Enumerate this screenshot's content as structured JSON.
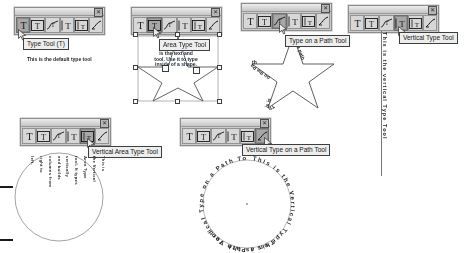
{
  "document": {
    "title": "Illustrator Type Tools Reference Sheet",
    "background_color": "#ffffff"
  },
  "toolbar": {
    "close_glyph": "✕",
    "icons": [
      {
        "name": "type-tool-icon",
        "glyph": "T",
        "label": "Type Tool"
      },
      {
        "name": "area-type-tool-icon",
        "glyph": "T",
        "label": "Area Type Tool"
      },
      {
        "name": "type-on-path-tool-icon",
        "glyph": "T",
        "label": "Type on a Path Tool"
      },
      {
        "name": "vertical-type-tool-icon",
        "glyph": "T",
        "label": "Vertical Type Tool"
      },
      {
        "name": "vertical-area-type-tool-icon",
        "glyph": "T",
        "label": "Vertical Area Type Tool"
      },
      {
        "name": "vertical-type-on-path-tool-icon",
        "glyph": "T",
        "label": "Vertical Type on a Path Tool"
      }
    ]
  },
  "panels": [
    {
      "id": "type-tool",
      "tooltip": "Type Tool (T)",
      "selected_index": 0,
      "caption": "This is the default type tool"
    },
    {
      "id": "area-type-tool",
      "tooltip": "Area Type Tool",
      "selected_index": 1,
      "artwork_text": "is the text and tool. Use it to type inside of a shape."
    },
    {
      "id": "type-on-a-path-tool",
      "tooltip": "Type on a Path Tool",
      "selected_index": 2,
      "path_text_segments": [
        "This is",
        "on the Path",
        "a path"
      ]
    },
    {
      "id": "vertical-type-tool",
      "tooltip": "Vertical Type Tool",
      "selected_index": 3,
      "vertical_text": "This is the vertical Type Tool"
    },
    {
      "id": "vertical-area-type-tool",
      "tooltip": "Vertical Area Type Tool",
      "selected_index": 4,
      "vertical_columns": [
        "This is",
        "the Vertical",
        "Area Type",
        "tool. It types",
        "vertically",
        "and builds",
        "columns from",
        "right to",
        "left."
      ]
    },
    {
      "id": "vertical-type-on-a-path-tool",
      "tooltip": "Vertical Type on a Path Tool",
      "selected_index": 5,
      "path_text": "This is the Vertical Type on a Path Tool"
    }
  ],
  "edge_marks": {
    "count": 2
  }
}
